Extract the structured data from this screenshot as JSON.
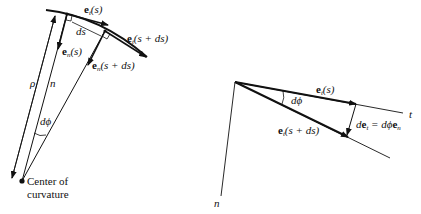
{
  "left_diagram": {
    "labels": {
      "et_s": {
        "vec": "e",
        "sub": "t",
        "arg": "(s)"
      },
      "et_sds": {
        "vec": "e",
        "sub": "t",
        "arg": "(s + ds)"
      },
      "en_s": {
        "vec": "e",
        "sub": "n",
        "arg": "(s)"
      },
      "en_sds": {
        "vec": "e",
        "sub": "n",
        "arg": "(s + ds)"
      },
      "ds": "ds",
      "rho": "ρ",
      "n": "n",
      "dphi": "dϕ",
      "center_line1": "Center of",
      "center_line2": "curvature"
    }
  },
  "right_diagram": {
    "labels": {
      "et_s": {
        "vec": "e",
        "sub": "t",
        "arg": "(s)"
      },
      "et_sds": {
        "vec": "e",
        "sub": "t",
        "arg": "(s + ds)"
      },
      "dphi": "dϕ",
      "det_lhs": "d",
      "det_vec": "e",
      "det_sub": "t",
      "det_eq": " = dϕ",
      "det_vec2": "e",
      "det_sub2": "n",
      "t": "t",
      "n": "n"
    }
  },
  "colors": {
    "ink": "#111111",
    "background": "#ffffff"
  }
}
